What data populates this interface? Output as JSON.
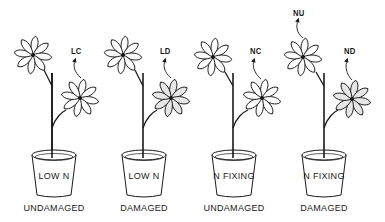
{
  "diagram": {
    "type": "illustration",
    "colors": {
      "line": "#1a1a1a",
      "background": "#ffffff",
      "damaged_leaf_fill": "#e6e6e6"
    }
  },
  "plants": [
    {
      "pot_label": "LOW N",
      "caption": "UNDAMAGED",
      "arrow_labels": [
        {
          "text": "LC",
          "target": "lower-whorl"
        }
      ]
    },
    {
      "pot_label": "LOW N",
      "caption": "DAMAGED",
      "arrow_labels": [
        {
          "text": "LD",
          "target": "lower-whorl"
        }
      ]
    },
    {
      "pot_label": "N FIXING",
      "caption": "UNDAMAGED",
      "arrow_labels": [
        {
          "text": "NC",
          "target": "lower-whorl"
        }
      ]
    },
    {
      "pot_label": "N FIXING",
      "caption": "DAMAGED",
      "arrow_labels": [
        {
          "text": "NU",
          "target": "upper-whorl"
        },
        {
          "text": "ND",
          "target": "lower-whorl"
        }
      ]
    }
  ]
}
